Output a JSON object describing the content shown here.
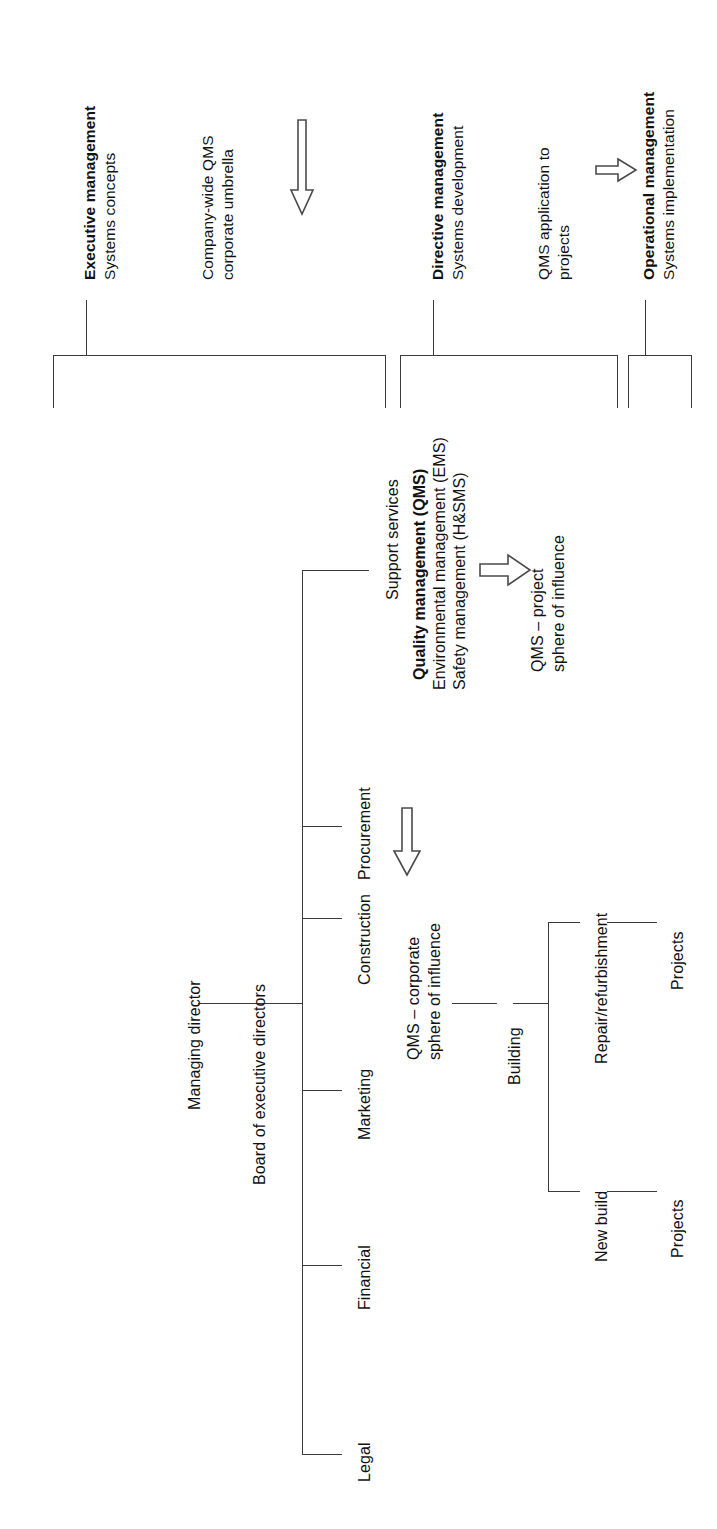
{
  "diagram": {
    "line_color": "#3a3a3a",
    "arrow_stroke": "#4a4a4a",
    "background": "#ffffff"
  },
  "management_levels": [
    {
      "id": "executive",
      "heading": "Executive management",
      "subheading": "Systems concepts",
      "scope_line1": "Company-wide QMS",
      "scope_line2": "corporate umbrella"
    },
    {
      "id": "directive",
      "heading": "Directive management",
      "subheading": "Systems development",
      "scope_line1": "QMS application to",
      "scope_line2": "projects"
    },
    {
      "id": "operational",
      "heading": "Operational management",
      "subheading": "Systems implementation",
      "scope_line1": "",
      "scope_line2": ""
    }
  ],
  "org": {
    "managing_director": "Managing director",
    "board": "Board of executive directors",
    "departments": [
      "Legal",
      "Financial",
      "Marketing",
      "Construction",
      "Procurement",
      "Support services"
    ],
    "support_services_systems": [
      "Quality management (QMS)",
      "Environmental management (EMS)",
      "Safety management (H&SMS)"
    ]
  },
  "construction_tree": {
    "root": "Building",
    "branches": [
      {
        "label": "New build",
        "child": "Projects"
      },
      {
        "label": "Repair/refurbishment",
        "child": "Projects"
      }
    ]
  },
  "annotations": {
    "corporate_sphere_line1": "QMS – corporate",
    "corporate_sphere_line2": "sphere of influence",
    "project_sphere_line1": "QMS – project",
    "project_sphere_line2": "sphere of influence"
  },
  "arrows": [
    {
      "id": "executive-to-directive",
      "direction": "down",
      "icon": "arrow-down-icon"
    },
    {
      "id": "directive-to-operational",
      "direction": "right",
      "icon": "arrow-right-icon"
    },
    {
      "id": "support-to-project-sphere",
      "direction": "right",
      "icon": "arrow-right-icon"
    },
    {
      "id": "procurement-to-corporate-sphere",
      "direction": "down",
      "icon": "arrow-down-icon"
    }
  ]
}
